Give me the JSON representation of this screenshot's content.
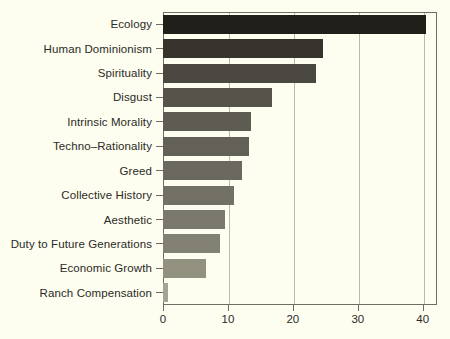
{
  "chart_data": {
    "type": "bar",
    "orientation": "horizontal",
    "title": "",
    "subtitle": "",
    "xlabel": "",
    "ylabel": "",
    "categories": [
      "Ecology",
      "Human Dominionism",
      "Spirituality",
      "Disgust",
      "Intrinsic Morality",
      "Techno–Rationality",
      "Greed",
      "Collective History",
      "Aesthetic",
      "Duty to Future Generations",
      "Economic Growth",
      "Ranch Compensation"
    ],
    "values": [
      40.5,
      24.6,
      23.5,
      16.8,
      13.5,
      13.3,
      12.2,
      11.0,
      9.6,
      8.8,
      6.6,
      0.8
    ],
    "bar_colors": [
      "#211f1a",
      "#35332c",
      "#4a4840",
      "#55534a",
      "#5d5b52",
      "#636157",
      "#6b695f",
      "#737166",
      "#7b796d",
      "#838173",
      "#93917f",
      "#a6a490"
    ],
    "xlim": [
      0,
      42.2
    ],
    "xticks": [
      0,
      10,
      20,
      30,
      40
    ],
    "xtick_labels": [
      "0",
      "10",
      "20",
      "30",
      "40"
    ],
    "grid": "vertical",
    "legend": "none",
    "background_color": "#fdfdf0",
    "frame_color": "#6e6e63",
    "gridline_color": "#b9b9ac",
    "text_color": "#2b2b26"
  }
}
